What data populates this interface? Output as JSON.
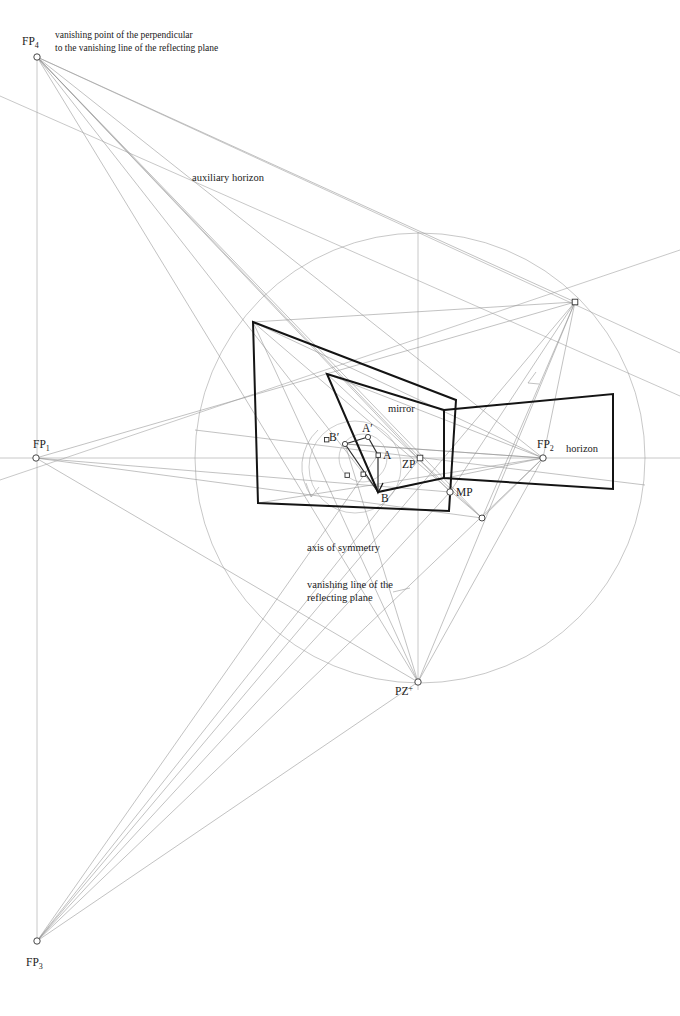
{
  "figure": {
    "background_color": "#ffffff",
    "line_color_faint": "#8c8c8c",
    "line_color_mid": "#6b6b6b",
    "line_color_heavy": "#141414",
    "text_color": "#1a1a1a"
  },
  "labels": {
    "fp1": {
      "base": "FP",
      "sub": "1"
    },
    "fp2": {
      "base": "FP",
      "sub": "2"
    },
    "fp3": {
      "base": "FP",
      "sub": "3"
    },
    "fp4": {
      "base": "FP",
      "sub": "4"
    },
    "pz": {
      "base": "PZ",
      "sup": "+"
    },
    "zp": "ZP",
    "mp": "MP",
    "point_a": "A",
    "point_a_prime": "A′",
    "point_b": "B",
    "point_b_prime": "B′",
    "mirror": "mirror",
    "horizon": "horizon",
    "auxiliary_horizon": "auxiliary horizon",
    "axis_of_symmetry": "axis of symmetry",
    "vanishing_line_1": "vanishing line of the",
    "vanishing_line_2": "reflecting plane",
    "fp4_desc_1": "vanishing point of the perpendicular",
    "fp4_desc_2": "to the vanishing line of the reflecting plane"
  },
  "points": {
    "fp1": {
      "x": 36,
      "y": 458
    },
    "fp2": {
      "x": 543,
      "y": 458
    },
    "fp3": {
      "x": 37,
      "y": 941
    },
    "fp4": {
      "x": 37,
      "y": 57
    },
    "pz": {
      "x": 418,
      "y": 682
    },
    "zp": {
      "x": 420,
      "y": 458
    },
    "mp": {
      "x": 450,
      "y": 492
    },
    "a": {
      "x": 378,
      "y": 455
    },
    "a_prime": {
      "x": 368,
      "y": 437
    },
    "b": {
      "x": 378,
      "y": 492
    },
    "b_prime": {
      "x": 345,
      "y": 444
    },
    "circle_right_marker": {
      "x": 575,
      "y": 302
    },
    "aux_marker": {
      "x": 482,
      "y": 518
    }
  },
  "circle": {
    "cx": 420,
    "cy": 458,
    "r": 225
  },
  "horizon_line": {
    "x1": 0,
    "y1": 458,
    "x2": 680,
    "y2": 458
  },
  "axis_vertical": {
    "x": 418,
    "y1": 230,
    "y2": 690
  }
}
